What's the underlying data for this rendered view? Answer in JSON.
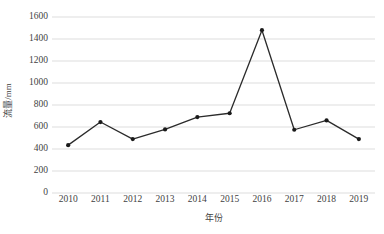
{
  "chart_data": {
    "type": "line",
    "title": "",
    "xlabel": "年份",
    "ylabel": "流量/mm",
    "categories": [
      "2010",
      "2011",
      "2012",
      "2013",
      "2014",
      "2015",
      "2016",
      "2017",
      "2018",
      "2019"
    ],
    "values": [
      435,
      645,
      490,
      578,
      690,
      725,
      1480,
      575,
      660,
      490
    ],
    "series": [
      {
        "name": "流量",
        "values": [
          435,
          645,
          490,
          578,
          690,
          725,
          1480,
          575,
          660,
          490
        ]
      }
    ],
    "ylim": [
      0,
      1600
    ],
    "ytick_values": [
      0,
      200,
      400,
      600,
      800,
      1000,
      1200,
      1400,
      1600
    ],
    "ytick_labels": [
      "0",
      "200",
      "400",
      "600",
      "800",
      "1000",
      "1200",
      "1400",
      "1600"
    ],
    "xtick_labels": [
      "2010",
      "2011",
      "2012",
      "2013",
      "2014",
      "2015",
      "2016",
      "2017",
      "2018",
      "2019"
    ],
    "grid": "horizontal",
    "legend": "none",
    "line_color": "#2b2b2b",
    "marker_color": "#1a1a1a",
    "grid_color": "#d4d4d4",
    "background_color": "#ffffff",
    "text_color": "#3f3f3f"
  }
}
